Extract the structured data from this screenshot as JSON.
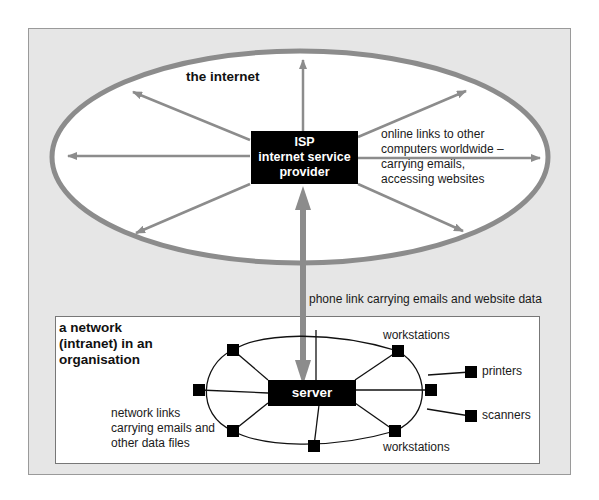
{
  "internet": {
    "title": "the internet",
    "isp": {
      "line1": "ISP",
      "line2": "internet service",
      "line3": "provider"
    },
    "links_text": {
      "line1": "online links to other",
      "line2": "computers worldwide –",
      "line3": "carrying emails,",
      "line4": "accessing websites"
    }
  },
  "phone_link": "phone link carrying emails and website data",
  "intranet": {
    "title": {
      "line1": "a network",
      "line2": "(intranet) in an",
      "line3": "organisation"
    },
    "server": "server",
    "workstations_top": "workstations",
    "workstations_bottom": "workstations",
    "printers": "printers",
    "scanners": "scanners",
    "network_links": {
      "line1": "network links",
      "line2": "carrying emails and",
      "line3": "other data files"
    }
  },
  "colors": {
    "ellipse": "#8c8c8c",
    "arrow": "#8c8c8c",
    "panel": "#e6e6e6",
    "node": "#000000"
  }
}
